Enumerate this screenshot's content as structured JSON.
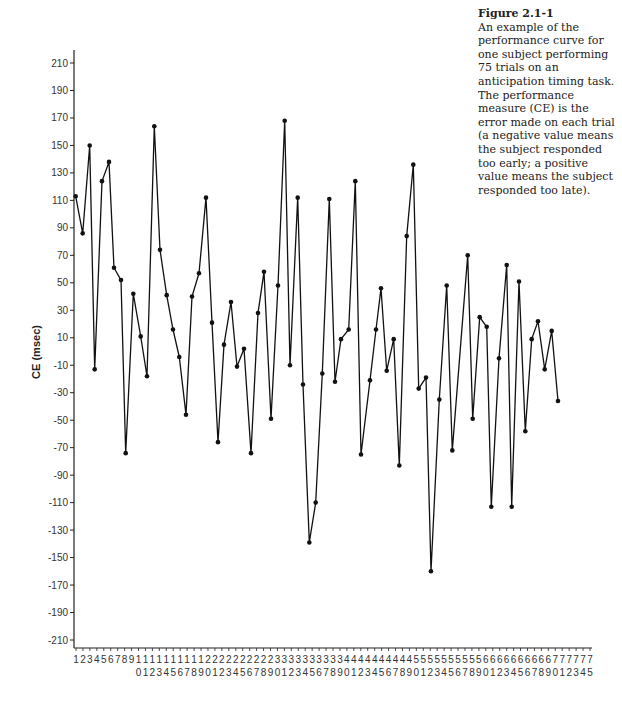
{
  "caption": {
    "title": "Figure 2.1-1",
    "text": "An example of the performance curve for one subject performing 75 trials on an anticipation timing task. The performance measure (CE) is the error made on each trial (a negative value means the subject responded too early; a positive value means the subject responded too late)."
  },
  "chart_data": {
    "type": "line",
    "title": "Figure 2.1-1",
    "xlabel": "",
    "ylabel": "CE (msec)",
    "ylim": [
      -210,
      210
    ],
    "yticks": [
      210,
      190,
      170,
      150,
      130,
      110,
      90,
      70,
      50,
      30,
      10,
      -10,
      -30,
      -50,
      -70,
      -90,
      -110,
      -130,
      -150,
      -170,
      -190,
      -210
    ],
    "xticks": [
      1,
      2,
      3,
      4,
      5,
      6,
      7,
      8,
      9,
      10,
      11,
      12,
      13,
      14,
      15,
      16,
      17,
      18,
      19,
      20,
      21,
      22,
      23,
      24,
      25,
      26,
      27,
      28,
      29,
      30,
      31,
      32,
      33,
      34,
      35,
      36,
      37,
      38,
      39,
      40,
      41,
      42,
      43,
      44,
      45,
      46,
      47,
      48,
      49,
      50,
      51,
      52,
      53,
      54,
      55,
      56,
      57,
      58,
      59,
      60,
      61,
      62,
      63,
      64,
      65,
      66,
      67,
      68,
      69,
      70,
      71,
      72,
      73,
      74,
      75
    ],
    "grid": false,
    "legend": null,
    "markers": true,
    "series": [
      {
        "name": "CE",
        "values": [
          113,
          86,
          150,
          -13,
          124,
          138,
          61,
          52,
          -74,
          42,
          11,
          -18,
          164,
          74,
          41,
          16,
          -4,
          -46,
          40,
          57,
          112,
          21,
          -66,
          5,
          36,
          -11,
          2,
          -74,
          28,
          58,
          -49,
          48,
          168,
          -10,
          112,
          -24,
          -139,
          -110,
          -16,
          111,
          -22,
          9,
          16,
          124,
          -75,
          -21,
          16,
          46,
          -14,
          9,
          -83,
          84,
          136,
          -27,
          -19,
          -160,
          -35,
          48,
          -72,
          70,
          -49,
          25,
          18,
          -113,
          -5,
          63,
          -113,
          51,
          -58,
          9,
          22,
          -13,
          15,
          -36
        ],
        "x_pixels": [
          75.7,
          82.7,
          89.7,
          94.7,
          102,
          109,
          114,
          121,
          125.7,
          133.3,
          140.7,
          147,
          154.3,
          160,
          166.7,
          173,
          179.3,
          186,
          192,
          199,
          206,
          212,
          218,
          224,
          231,
          237,
          244,
          251,
          258,
          264,
          271,
          278,
          284.7,
          290,
          297.7,
          303,
          309.3,
          315.7,
          322.3,
          329.3,
          335,
          341,
          348.7,
          355.3,
          361,
          370,
          376,
          381,
          386.7,
          393.7,
          399.3,
          406.7,
          413.3,
          418.7,
          426,
          431,
          439.3,
          446.7,
          452.3,
          467.7,
          472.7,
          479.7,
          486.7,
          491.3,
          499,
          506.7,
          511.7,
          519,
          525.3,
          531.7,
          538,
          544.7,
          551.7,
          558
        ]
      }
    ]
  }
}
